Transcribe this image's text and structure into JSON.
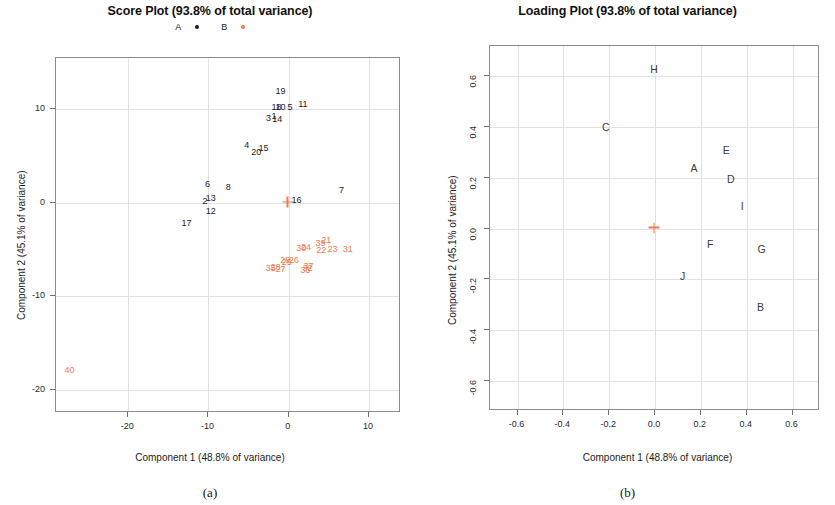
{
  "figure": {
    "panel_a": {
      "caption": "(a)",
      "title": "Score Plot (93.8% of total variance)",
      "legend": [
        {
          "label": "A",
          "marker": "black-dot",
          "color": "#1b1b1b"
        },
        {
          "label": "B",
          "marker": "orange-dot",
          "color": "#f2784b"
        }
      ],
      "xlabel": "Component 1 (48.8% of variance)",
      "ylabel": "Component 2 (45.1% of variance)"
    },
    "panel_b": {
      "caption": "(b)",
      "title": "Loading Plot (93.8% of total variance)",
      "xlabel": "Component 1 (48.8% of variance)",
      "ylabel": "Component 2 (45.1% of variance)"
    }
  },
  "chart_data": [
    {
      "type": "scatter",
      "id": "score-plot",
      "title": "Score Plot (93.8% of total variance)",
      "xlabel": "Component 1 (48.8% of variance)",
      "ylabel": "Component 2 (45.1% of variance)",
      "xlim": [
        -29,
        14
      ],
      "ylim": [
        -22.5,
        15.5
      ],
      "xticks": [
        -20,
        -10,
        0,
        10
      ],
      "yticks": [
        -20,
        -10,
        0,
        10
      ],
      "grid": true,
      "legend": [
        "A",
        "B"
      ],
      "legend_position": "top-center",
      "origin_marker": {
        "x": 0,
        "y": 0,
        "symbol": "+",
        "color": "#f2784b"
      },
      "series": [
        {
          "name": "A",
          "color": "#1b1b1b",
          "marker": "text-label",
          "points": [
            {
              "label": "19",
              "x": -0.9,
              "y": 11.9
            },
            {
              "label": "10",
              "x": -0.9,
              "y": 10.2
            },
            {
              "label": "18",
              "x": -1.4,
              "y": 10.2
            },
            {
              "label": "5",
              "x": 0.3,
              "y": 10.1
            },
            {
              "label": "11",
              "x": 1.9,
              "y": 10.5
            },
            {
              "label": "1",
              "x": -1.7,
              "y": 9.2
            },
            {
              "label": "3",
              "x": -2.4,
              "y": 9.0
            },
            {
              "label": "14",
              "x": -1.3,
              "y": 8.9
            },
            {
              "label": "4",
              "x": -5.1,
              "y": 6.1
            },
            {
              "label": "20",
              "x": -3.9,
              "y": 5.3
            },
            {
              "label": "15",
              "x": -3.0,
              "y": 5.8
            },
            {
              "label": "6",
              "x": -10.0,
              "y": 1.9
            },
            {
              "label": "8",
              "x": -7.4,
              "y": 1.6
            },
            {
              "label": "2",
              "x": -10.3,
              "y": 0.1
            },
            {
              "label": "13",
              "x": -9.6,
              "y": 0.4
            },
            {
              "label": "12",
              "x": -9.6,
              "y": -1.0
            },
            {
              "label": "17",
              "x": -12.6,
              "y": -2.3
            },
            {
              "label": "16",
              "x": 1.1,
              "y": 0.2
            },
            {
              "label": "7",
              "x": 6.7,
              "y": 1.3
            }
          ]
        },
        {
          "name": "B",
          "color": "#ef7a4f",
          "marker": "text-label",
          "points": [
            {
              "label": "39",
              "x": 4.1,
              "y": -4.4
            },
            {
              "label": "21",
              "x": 4.8,
              "y": -4.1
            },
            {
              "label": "22",
              "x": 4.2,
              "y": -5.2
            },
            {
              "label": "23",
              "x": 5.6,
              "y": -5.0
            },
            {
              "label": "31",
              "x": 7.5,
              "y": -5.1
            },
            {
              "label": "30",
              "x": 1.7,
              "y": -4.9
            },
            {
              "label": "24",
              "x": 2.3,
              "y": -4.8
            },
            {
              "label": "29",
              "x": -0.3,
              "y": -6.2
            },
            {
              "label": "26",
              "x": 0.8,
              "y": -6.2
            },
            {
              "label": "25",
              "x": -0.1,
              "y": -6.4
            },
            {
              "label": "28",
              "x": -1.5,
              "y": -7.0
            },
            {
              "label": "35",
              "x": -2.1,
              "y": -7.1
            },
            {
              "label": "27",
              "x": -0.9,
              "y": -7.2
            },
            {
              "label": "37",
              "x": 2.6,
              "y": -6.9
            },
            {
              "label": "32",
              "x": 2.5,
              "y": -7.1
            },
            {
              "label": "33",
              "x": 2.2,
              "y": -7.3
            },
            {
              "label": "40",
              "x": -27.2,
              "y": -18.0
            }
          ]
        }
      ]
    },
    {
      "type": "scatter",
      "id": "loading-plot",
      "title": "Loading Plot (93.8% of total variance)",
      "xlabel": "Component 1 (48.8% of variance)",
      "ylabel": "Component 2 (45.1% of variance)",
      "xlim": [
        -0.72,
        0.72
      ],
      "ylim": [
        -0.72,
        0.72
      ],
      "xticks": [
        -0.6,
        -0.4,
        -0.2,
        0.0,
        0.2,
        0.4,
        0.6
      ],
      "xticklabels": [
        "-0.6",
        "-0.4",
        "-0.2",
        "0.0",
        "0.2",
        "0.4",
        "0.6"
      ],
      "yticks": [
        -0.6,
        -0.4,
        -0.2,
        0.0,
        0.2,
        0.4,
        0.6
      ],
      "yticklabels": [
        "-0.6",
        "-0.4",
        "-0.2",
        "0.0",
        "0.2",
        "0.4",
        "0.6"
      ],
      "grid": true,
      "origin_marker": {
        "x": 0,
        "y": 0,
        "symbol": "+",
        "color": "#f2784b"
      },
      "series": [
        {
          "name": "loadings",
          "color": "#3a3a3a",
          "marker": "text-label",
          "points": [
            {
              "label": "H",
              "x": 0.0,
              "y": 0.625
            },
            {
              "label": "C",
              "x": -0.21,
              "y": 0.395
            },
            {
              "label": "E",
              "x": 0.315,
              "y": 0.305
            },
            {
              "label": "A",
              "x": 0.175,
              "y": 0.235
            },
            {
              "label": "D",
              "x": 0.335,
              "y": 0.19
            },
            {
              "label": "I",
              "x": 0.385,
              "y": 0.085
            },
            {
              "label": "F",
              "x": 0.245,
              "y": -0.065
            },
            {
              "label": "G",
              "x": 0.47,
              "y": -0.085
            },
            {
              "label": "J",
              "x": 0.125,
              "y": -0.19
            },
            {
              "label": "B",
              "x": 0.465,
              "y": -0.315
            }
          ]
        }
      ]
    }
  ]
}
